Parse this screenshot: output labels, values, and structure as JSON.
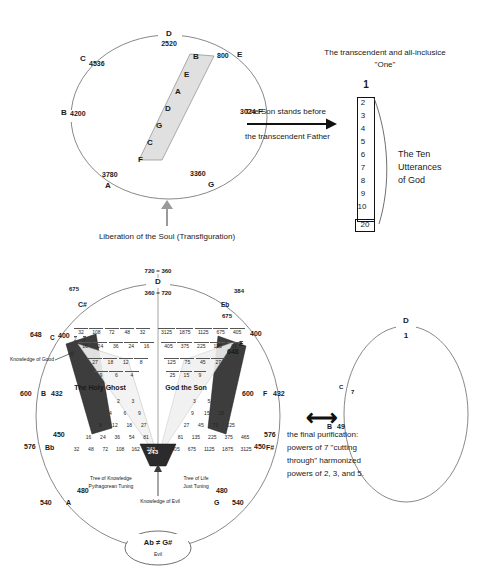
{
  "meta": {
    "bg_color": "#ffffff",
    "ink_color": "#1a1a1a"
  },
  "top_circle": {
    "name": "transfiguration-circle",
    "note_labels": [
      {
        "note": "D",
        "value": "2520",
        "pos": "top"
      },
      {
        "note": "C",
        "value": "4536",
        "pos": "upper-left"
      },
      {
        "note": "B",
        "value": "4200",
        "pos": "left"
      },
      {
        "note": "A",
        "value": "3780",
        "pos": "lower-left"
      },
      {
        "note": "G",
        "value": "3360",
        "pos": "lower-right"
      },
      {
        "note": "F",
        "value": "3024",
        "pos": "right"
      },
      {
        "note": "E",
        "value": "800",
        "pos": "upper-right"
      }
    ],
    "band_notes": [
      "B",
      "E",
      "A",
      "D",
      "G",
      "C",
      "F"
    ]
  },
  "liberation_caption": "Liberation of the Soul (Transfiguration)",
  "transition_arrow": {
    "line_1": "The Son stands before",
    "line_2": "the transcendent Father"
  },
  "utterances": {
    "heading_line_1": "The transcendent and all-inclusice",
    "heading_line_2": "\"One\"",
    "top_number": "1",
    "numbers": [
      "2",
      "3",
      "4",
      "5",
      "6",
      "7",
      "8",
      "9",
      "10"
    ],
    "final_number": "20",
    "label_line_1": "The Ten",
    "label_line_2": "Utterances",
    "label_line_3": "of God"
  },
  "main_circle": {
    "name": "tuning-circle",
    "top_equation_upper": "720 = 360",
    "top_equation_lower": "360 = 720",
    "notes": [
      {
        "note": "D",
        "outer": "",
        "inner": ""
      },
      {
        "note": "C#",
        "outer": "675",
        "inner": ""
      },
      {
        "note": "C",
        "outer": "648",
        "inner": "400"
      },
      {
        "note": "B",
        "outer": "600",
        "inner": "432"
      },
      {
        "note": "Bb",
        "outer": "576",
        "inner": "450"
      },
      {
        "note": "A",
        "outer": "540",
        "inner": "480"
      },
      {
        "note": "Eb",
        "outer": "384",
        "inner": "675"
      },
      {
        "note": "E",
        "outer": "400",
        "inner": "648"
      },
      {
        "note": "F",
        "outer": "600",
        "inner": "432"
      },
      {
        "note": "F#",
        "outer": "576",
        "inner": "450"
      },
      {
        "note": "G",
        "outer": "540",
        "inner": "480"
      }
    ],
    "left_triangle_label": "The Holy Ghost",
    "right_triangle_label": "God the Son",
    "knowledge_of_good": "Knowledge of Good",
    "knowledge_of_evil": "Knowledge of Evil",
    "tree_left_line_1": "Tree of Knowledge",
    "tree_left_line_2": "Pythagorean Tuning",
    "tree_right_line_1": "Tree of Life",
    "tree_right_line_2": "Just Tuning",
    "bottom_bubble_line_1": "Ab ≠ G#",
    "bottom_bubble_line_2": "Evil",
    "lattice_left": [
      [
        "2",
        "3"
      ],
      [
        "4",
        "6",
        "9"
      ],
      [
        "8",
        "12",
        "18",
        "27"
      ],
      [
        "16",
        "24",
        "36",
        "54",
        "81"
      ],
      [
        "32",
        "48",
        "72",
        "108",
        "162",
        "243"
      ]
    ],
    "lattice_right": [
      [
        "3",
        "5"
      ],
      [
        "9",
        "15",
        "25"
      ],
      [
        "27",
        "45",
        "75",
        "125"
      ],
      [
        "81",
        "135",
        "225",
        "375",
        "625"
      ],
      [
        "243",
        "405",
        "675",
        "1125",
        "1875",
        "3125"
      ]
    ],
    "lattice_left_fractions": [
      [
        "1/2",
        "1/3"
      ],
      [
        "1/4",
        "1/6",
        "1/9"
      ],
      [
        "1/8",
        "1/12",
        "1/18",
        "1/27"
      ],
      [
        "1/16",
        "1/24",
        "1/36",
        "1/54",
        "1/81"
      ],
      [
        "1/32",
        "1/48",
        "1/72",
        "1/108",
        "1/162",
        "1/243"
      ]
    ],
    "lattice_right_fractions": [
      [
        "1/3",
        "1/5"
      ],
      [
        "1/9",
        "1/15",
        "1/25"
      ],
      [
        "1/27",
        "1/45",
        "1/75",
        "1/125"
      ],
      [
        "1/81",
        "1/135",
        "1/225",
        "1/375",
        "1/625"
      ],
      [
        "1/243",
        "1/405",
        "1/675",
        "1/1125",
        "1/1875",
        "1/3125"
      ]
    ]
  },
  "right_circle": {
    "name": "purification-circle",
    "notes": [
      {
        "note": "D",
        "value": "1"
      },
      {
        "note": "C",
        "value": "7"
      },
      {
        "note": "B",
        "value": "49"
      }
    ]
  },
  "purification_caption": {
    "line_1": "the final purification:",
    "line_2": "powers of 7 \"cutting",
    "line_3": "through\" harmonized",
    "line_4": "powers of 2, 3, and 5."
  },
  "double_arrow_glyph": "⟷"
}
